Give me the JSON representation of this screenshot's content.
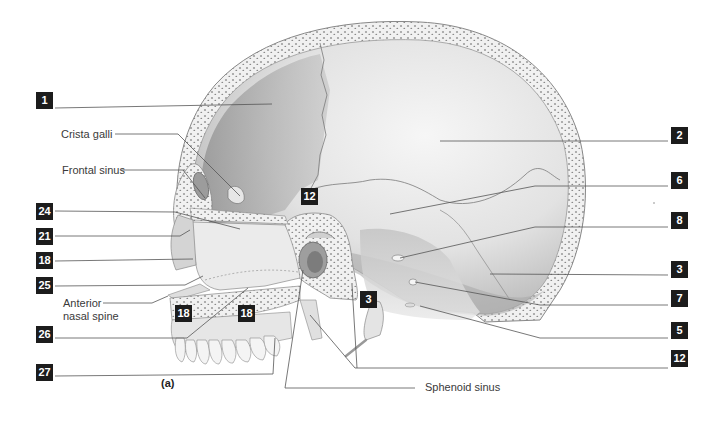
{
  "figure": {
    "caption": "(a)"
  },
  "labels": {
    "left_numbers": [
      {
        "id": "1",
        "text": "1",
        "x": 36,
        "y": 92
      },
      {
        "id": "24",
        "text": "24",
        "x": 36,
        "y": 203
      },
      {
        "id": "21",
        "text": "21",
        "x": 36,
        "y": 228
      },
      {
        "id": "18",
        "text": "18",
        "x": 36,
        "y": 252
      },
      {
        "id": "25",
        "text": "25",
        "x": 36,
        "y": 277
      },
      {
        "id": "26",
        "text": "26",
        "x": 36,
        "y": 326
      },
      {
        "id": "27",
        "text": "27",
        "x": 36,
        "y": 364
      }
    ],
    "right_numbers": [
      {
        "id": "2",
        "text": "2",
        "x": 671,
        "y": 127
      },
      {
        "id": "6",
        "text": "6",
        "x": 671,
        "y": 172
      },
      {
        "id": "8",
        "text": "8",
        "x": 671,
        "y": 212
      },
      {
        "id": "3",
        "text": "3",
        "x": 671,
        "y": 261
      },
      {
        "id": "7",
        "text": "7",
        "x": 671,
        "y": 290
      },
      {
        "id": "5",
        "text": "5",
        "x": 671,
        "y": 322
      },
      {
        "id": "12",
        "text": "12",
        "x": 671,
        "y": 350
      }
    ],
    "inner_numbers": [
      {
        "id": "12",
        "text": "12",
        "x": 301,
        "y": 188
      },
      {
        "id": "3",
        "text": "3",
        "x": 360,
        "y": 291
      },
      {
        "id": "18a",
        "text": "18",
        "x": 175,
        "y": 305
      },
      {
        "id": "18b",
        "text": "18",
        "x": 238,
        "y": 305
      }
    ],
    "text_labels": [
      {
        "id": "crista-galli",
        "text": "Crista galli",
        "x": 61,
        "y": 129
      },
      {
        "id": "frontal-sinus",
        "text": "Frontal sinus",
        "x": 62,
        "y": 165
      },
      {
        "id": "anterior-nasal-spine-1",
        "text": "Anterior",
        "x": 63,
        "y": 298
      },
      {
        "id": "anterior-nasal-spine-2",
        "text": "nasal spine",
        "x": 63,
        "y": 311
      },
      {
        "id": "sphenoid-sinus",
        "text": "Sphenoid sinus",
        "x": 425,
        "y": 382
      }
    ]
  },
  "colors": {
    "label_box": "#1c1c1c",
    "leader_line": "#555555",
    "bone_light": "#ededed",
    "bone_mid": "#c8c8c8",
    "bone_dark": "#9a9a9a",
    "spongy_dots": "#7a7a7a"
  }
}
